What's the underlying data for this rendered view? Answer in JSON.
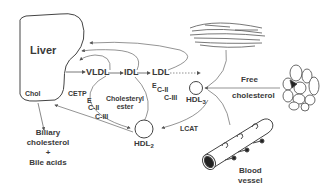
{
  "diagram": {
    "nodes": {
      "liver": "Liver",
      "chol": "Chol",
      "vldl": "VLDL",
      "idl": "IDL",
      "ldl": "LDL",
      "hdl3_base": "HDL",
      "hdl3_sub": "3",
      "hdl2_base": "HDL",
      "hdl2_sub": "2",
      "free_chol_line1": "Free",
      "free_chol_line2": "cholesterol",
      "blood_vessel_line1": "Blood",
      "blood_vessel_line2": "vessel",
      "biliary_line1": "Biliary",
      "biliary_line2": "cholesterol",
      "biliary_plus": "+",
      "biliary_line3": "Bile acids"
    },
    "labels": {
      "cetp": "CETP",
      "e_left": "E",
      "cii_left": "C-II",
      "ciii_left": "C-III",
      "chol_ester_line1": "Cholesteryl",
      "chol_ester_line2": "ester",
      "e_right": "E",
      "cii_right": "C-II",
      "ciii_right": "C-III",
      "lcat": "LCAT"
    },
    "icons": [
      "liver-shape",
      "muscle-tissue-icon",
      "adipocyte-cluster-icon",
      "blood-vessel-icon",
      "hdl-particle-icon"
    ]
  }
}
